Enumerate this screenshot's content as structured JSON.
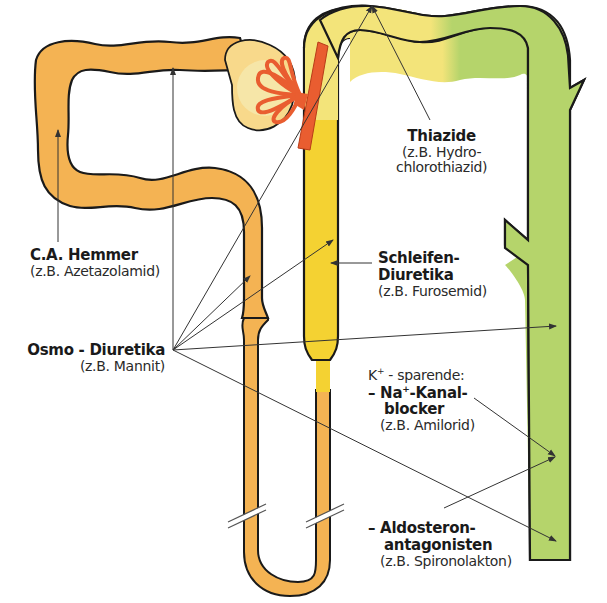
{
  "colors": {
    "proximal_tubule": "#f4b353",
    "bowman_capsule": "#f8d98b",
    "glomerulus": "#e95d30",
    "thick_ascending": "#f4d232",
    "distal_light": "#f3e47a",
    "collecting_duct": "#b5d46b",
    "outline": "#1a1a1a",
    "arrow": "#333333"
  },
  "labels": {
    "ca_hemmer": {
      "title": "C.A. Hemmer",
      "example": "(z.B. Azetazolamid)"
    },
    "osmo": {
      "title": "Osmo - Diuretika",
      "example": "(z.B. Mannit)"
    },
    "thiazide": {
      "title": "Thiazide",
      "example_line1": "(z.B. Hydro-",
      "example_line2": "chlorothiazid)"
    },
    "schleifen": {
      "title_line1": "Schleifen-",
      "title_line2": "Diuretika",
      "example": "(z.B. Furosemid)"
    },
    "k_sparende": {
      "heading_prefix": "K",
      "heading_sup": "+",
      "heading_suffix": " - sparende:",
      "na_prefix": "– Na",
      "na_sup": "+",
      "na_suffix": "-Kanal-",
      "na_line2": "blocker",
      "na_example": "(z.B. Amilorid)",
      "aldo_line1": "– Aldosteron-",
      "aldo_line2": "antagonisten",
      "aldo_example": "(z.B. Spironolakton)"
    }
  }
}
